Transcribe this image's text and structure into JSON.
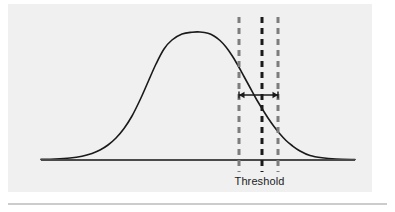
{
  "figure": {
    "title": "",
    "background_color": "#f0f0f0",
    "page_background_color": "#ffffff",
    "panel": {
      "x": 8,
      "y": 4,
      "width": 364,
      "height": 188
    },
    "annotations": {
      "threshold_label": "Threshold"
    },
    "divider": {
      "name": "bottom-rule",
      "color": "#9a9a9a",
      "y": 204,
      "x1": 8,
      "x2": 387
    }
  },
  "chart_data": {
    "type": "line",
    "title": "",
    "xlabel": "",
    "ylabel": "",
    "grid": false,
    "legend": "none",
    "xlim": [
      0,
      395
    ],
    "ylim": [
      0,
      212
    ],
    "series": [
      {
        "name": "distribution-curve",
        "color": "#1a1a1a",
        "line_width": 1.6,
        "x": [
          41,
          55,
          70,
          82,
          92,
          100,
          108,
          116,
          124,
          132,
          140,
          148,
          156,
          164,
          172,
          182,
          192,
          200,
          208,
          214,
          220,
          226,
          232,
          238,
          244,
          250,
          256,
          262,
          268,
          274,
          280,
          286,
          292,
          300,
          310,
          322,
          336,
          355
        ],
        "y": [
          159.4,
          159.0,
          158.0,
          156.2,
          153.4,
          150.0,
          145.0,
          138.0,
          128.5,
          116.0,
          100.0,
          82.0,
          64.0,
          49.0,
          40.0,
          34.0,
          32.2,
          32.0,
          33.2,
          36.0,
          40.5,
          47.0,
          55.5,
          65.5,
          76.5,
          87.5,
          98.5,
          108.5,
          118.0,
          126.5,
          134.0,
          140.5,
          145.5,
          151.0,
          155.5,
          157.8,
          159.0,
          159.5
        ]
      }
    ],
    "baseline": {
      "name": "axis-baseline",
      "color": "#4a4a4a",
      "y": 160,
      "x1": 41,
      "x2": 355,
      "line_width": 2.2
    },
    "vertical_markers": [
      {
        "name": "lower-tolerance-line",
        "x": 239,
        "y1": 17,
        "y2": 172,
        "color": "#7d7d7d",
        "line_width": 3,
        "dash": "6,5"
      },
      {
        "name": "threshold-line",
        "x": 262,
        "y1": 17,
        "y2": 172,
        "color": "#1a1a1a",
        "line_width": 3,
        "dash": "6,5"
      },
      {
        "name": "upper-tolerance-line",
        "x": 278,
        "y1": 17,
        "y2": 172,
        "color": "#7d7d7d",
        "line_width": 3,
        "dash": "6,5"
      }
    ],
    "span_arrow": {
      "name": "tolerance-span-arrow",
      "x1": 239,
      "x2": 278,
      "y": 95,
      "color": "#1a1a1a",
      "line_width": 1.6,
      "double_headed": true
    }
  }
}
